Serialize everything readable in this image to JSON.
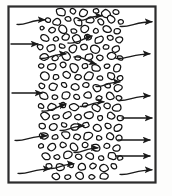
{
  "figure": {
    "canvas": {
      "width": 172,
      "height": 196,
      "background": "#fdfdfc"
    },
    "frame": {
      "label": "enclosure-boundary",
      "x": 8.5,
      "y": 6.5,
      "width": 147,
      "height": 176,
      "stroke": "#2b2b2b",
      "stroke_width": 2.2,
      "fill": "#ffffff"
    },
    "bed": {
      "label": "packed-particle-bed",
      "band_left": 36,
      "band_right": 122,
      "particle_stroke": "#111111",
      "particle_stroke_width": 1.25,
      "particle_fill": "#ffffff",
      "particle_count": 118
    },
    "colors": {
      "ink": "#1a1a1a",
      "frame": "#2b2b2b",
      "paper": "#ffffff",
      "page": "#fdfdfc"
    },
    "inlet_arrows": [
      {
        "name": "inlet-arrow-1",
        "style": "wavy",
        "y": 22,
        "x_start": 17,
        "x_end": 45
      },
      {
        "name": "inlet-arrow-2",
        "style": "straight",
        "y": 44,
        "x_start": 11,
        "x_end": 38
      },
      {
        "name": "inlet-arrow-3",
        "style": "straight",
        "y": 93,
        "x_start": 12,
        "x_end": 42
      },
      {
        "name": "inlet-arrow-4",
        "style": "wavy",
        "y": 138,
        "x_start": 15,
        "x_end": 47
      },
      {
        "name": "inlet-arrow-5",
        "style": "wavy",
        "y": 171,
        "x_start": 18,
        "x_end": 50
      }
    ],
    "outlet_arrows": [
      {
        "name": "outlet-arrow-1",
        "style": "wavy",
        "y": 24,
        "x_start": 120,
        "x_end": 152
      },
      {
        "name": "outlet-arrow-2",
        "style": "wavy",
        "y": 56,
        "x_start": 116,
        "x_end": 150
      },
      {
        "name": "outlet-arrow-3",
        "style": "wavy",
        "y": 98,
        "x_start": 118,
        "x_end": 150
      },
      {
        "name": "outlet-arrow-4",
        "style": "straight",
        "y": 118,
        "x_start": 122,
        "x_end": 152
      },
      {
        "name": "outlet-arrow-5",
        "style": "straight",
        "y": 140,
        "x_start": 118,
        "x_end": 150
      },
      {
        "name": "outlet-arrow-6",
        "style": "straight",
        "y": 156,
        "x_start": 116,
        "x_end": 150
      },
      {
        "name": "outlet-arrow-7",
        "style": "wavy",
        "y": 172,
        "x_start": 120,
        "x_end": 152
      }
    ],
    "interior_arrows": [
      {
        "name": "interior-arrow-1",
        "style": "wavy",
        "y": 18,
        "x_start": 78,
        "x_end": 102
      },
      {
        "name": "interior-arrow-2",
        "style": "wavy-up",
        "y": 40,
        "x_start": 68,
        "x_end": 92
      },
      {
        "name": "interior-arrow-3",
        "style": "wavy",
        "y": 56,
        "x_start": 40,
        "x_end": 66
      },
      {
        "name": "interior-arrow-4",
        "style": "wavy-down",
        "y": 60,
        "x_start": 74,
        "x_end": 96
      },
      {
        "name": "interior-arrow-5",
        "style": "wavy",
        "y": 84,
        "x_start": 96,
        "x_end": 120
      },
      {
        "name": "interior-arrow-6",
        "style": "wavy-up",
        "y": 108,
        "x_start": 42,
        "x_end": 66
      },
      {
        "name": "interior-arrow-7",
        "style": "wavy",
        "y": 104,
        "x_start": 80,
        "x_end": 104
      },
      {
        "name": "interior-arrow-8",
        "style": "wavy",
        "y": 128,
        "x_start": 60,
        "x_end": 84
      },
      {
        "name": "interior-arrow-9",
        "style": "wavy",
        "y": 150,
        "x_start": 74,
        "x_end": 98
      },
      {
        "name": "interior-arrow-10",
        "style": "wavy",
        "y": 166,
        "x_start": 50,
        "x_end": 74
      }
    ],
    "particles": [
      [
        61,
        12,
        5.0,
        4.0,
        12
      ],
      [
        73,
        11,
        3.4,
        2.8,
        40
      ],
      [
        83,
        13,
        4.6,
        3.6,
        -20
      ],
      [
        96,
        11,
        3.0,
        2.6,
        15
      ],
      [
        106,
        14,
        5.2,
        4.2,
        30
      ],
      [
        116,
        12,
        3.2,
        2.6,
        0
      ],
      [
        48,
        20,
        3.0,
        2.4,
        10
      ],
      [
        57,
        22,
        4.4,
        3.4,
        -15
      ],
      [
        68,
        19,
        3.2,
        2.6,
        25
      ],
      [
        78,
        22,
        5.0,
        3.8,
        50
      ],
      [
        90,
        20,
        4.2,
        3.4,
        -10
      ],
      [
        101,
        22,
        3.4,
        2.8,
        35
      ],
      [
        111,
        19,
        4.8,
        3.8,
        20
      ],
      [
        121,
        22,
        3.0,
        2.4,
        0
      ],
      [
        42,
        28,
        2.2,
        1.9,
        0
      ],
      [
        52,
        30,
        3.4,
        2.8,
        -25
      ],
      [
        63,
        29,
        5.0,
        4.0,
        45
      ],
      [
        74,
        31,
        3.2,
        2.6,
        10
      ],
      [
        85,
        29,
        4.6,
        3.6,
        -30
      ],
      [
        96,
        31,
        3.0,
        2.5,
        20
      ],
      [
        107,
        29,
        4.4,
        3.4,
        15
      ],
      [
        117,
        31,
        3.6,
        2.9,
        -15
      ],
      [
        45,
        38,
        4.6,
        3.6,
        25
      ],
      [
        56,
        39,
        3.0,
        2.4,
        0
      ],
      [
        66,
        37,
        4.2,
        3.4,
        -20
      ],
      [
        77,
        39,
        5.0,
        4.0,
        35
      ],
      [
        88,
        37,
        3.4,
        2.8,
        10
      ],
      [
        99,
        40,
        4.6,
        3.6,
        -25
      ],
      [
        110,
        38,
        3.2,
        2.6,
        15
      ],
      [
        119,
        40,
        4.0,
        3.2,
        0
      ],
      [
        40,
        47,
        3.2,
        2.6,
        20
      ],
      [
        51,
        48,
        4.8,
        3.8,
        -10
      ],
      [
        62,
        46,
        3.0,
        2.4,
        30
      ],
      [
        73,
        49,
        4.4,
        3.5,
        -35
      ],
      [
        84,
        47,
        3.4,
        2.8,
        0
      ],
      [
        95,
        49,
        5.0,
        3.9,
        25
      ],
      [
        106,
        47,
        3.2,
        2.6,
        10
      ],
      [
        116,
        49,
        4.2,
        3.4,
        -20
      ],
      [
        44,
        57,
        4.4,
        3.5,
        15
      ],
      [
        55,
        58,
        3.2,
        2.6,
        -20
      ],
      [
        66,
        56,
        4.8,
        3.8,
        40
      ],
      [
        78,
        58,
        3.0,
        2.4,
        0
      ],
      [
        89,
        57,
        4.4,
        3.5,
        -15
      ],
      [
        100,
        58,
        3.4,
        2.8,
        25
      ],
      [
        111,
        56,
        4.6,
        3.6,
        -10
      ],
      [
        120,
        58,
        3.0,
        2.4,
        20
      ],
      [
        41,
        66,
        3.0,
        2.5,
        0
      ],
      [
        52,
        67,
        4.6,
        3.6,
        -25
      ],
      [
        63,
        65,
        3.4,
        2.8,
        15
      ],
      [
        74,
        68,
        5.0,
        3.9,
        35
      ],
      [
        85,
        66,
        3.2,
        2.6,
        -10
      ],
      [
        96,
        68,
        4.4,
        3.5,
        20
      ],
      [
        107,
        66,
        3.0,
        2.4,
        0
      ],
      [
        117,
        68,
        4.6,
        3.6,
        -30
      ],
      [
        45,
        76,
        4.8,
        3.8,
        20
      ],
      [
        56,
        77,
        3.2,
        2.6,
        -15
      ],
      [
        67,
        75,
        4.2,
        3.4,
        30
      ],
      [
        78,
        77,
        3.4,
        2.8,
        0
      ],
      [
        89,
        76,
        5.0,
        3.9,
        -25
      ],
      [
        100,
        78,
        3.0,
        2.4,
        15
      ],
      [
        111,
        76,
        4.4,
        3.5,
        35
      ],
      [
        120,
        78,
        3.4,
        2.8,
        -10
      ],
      [
        42,
        86,
        3.4,
        2.8,
        10
      ],
      [
        53,
        87,
        4.6,
        3.6,
        -20
      ],
      [
        64,
        85,
        3.0,
        2.4,
        25
      ],
      [
        75,
        87,
        4.4,
        3.5,
        0
      ],
      [
        86,
        85,
        3.4,
        2.8,
        -15
      ],
      [
        97,
        88,
        4.8,
        3.8,
        30
      ],
      [
        108,
        86,
        3.2,
        2.6,
        10
      ],
      [
        118,
        88,
        4.2,
        3.4,
        -25
      ],
      [
        44,
        96,
        4.4,
        3.5,
        25
      ],
      [
        55,
        97,
        3.0,
        2.4,
        0
      ],
      [
        66,
        95,
        4.8,
        3.8,
        -20
      ],
      [
        77,
        97,
        3.4,
        2.8,
        35
      ],
      [
        88,
        95,
        4.2,
        3.4,
        10
      ],
      [
        99,
        98,
        3.0,
        2.5,
        -15
      ],
      [
        110,
        96,
        4.6,
        3.6,
        20
      ],
      [
        119,
        98,
        3.2,
        2.6,
        0
      ],
      [
        41,
        106,
        3.2,
        2.6,
        15
      ],
      [
        52,
        107,
        4.6,
        3.6,
        -30
      ],
      [
        63,
        105,
        3.4,
        2.8,
        20
      ],
      [
        74,
        107,
        4.8,
        3.8,
        0
      ],
      [
        85,
        105,
        3.0,
        2.4,
        -10
      ],
      [
        96,
        108,
        4.4,
        3.5,
        25
      ],
      [
        107,
        106,
        3.4,
        2.8,
        15
      ],
      [
        117,
        108,
        4.6,
        3.6,
        -20
      ],
      [
        45,
        116,
        4.8,
        3.8,
        30
      ],
      [
        56,
        117,
        3.2,
        2.6,
        0
      ],
      [
        67,
        115,
        4.2,
        3.4,
        -25
      ],
      [
        78,
        117,
        3.4,
        2.8,
        20
      ],
      [
        89,
        115,
        4.6,
        3.6,
        10
      ],
      [
        100,
        118,
        3.0,
        2.4,
        -15
      ],
      [
        111,
        116,
        4.4,
        3.5,
        35
      ],
      [
        120,
        118,
        3.4,
        2.8,
        0
      ],
      [
        42,
        126,
        3.4,
        2.8,
        20
      ],
      [
        53,
        127,
        4.4,
        3.5,
        -10
      ],
      [
        64,
        125,
        3.0,
        2.4,
        30
      ],
      [
        75,
        127,
        4.8,
        3.8,
        0
      ],
      [
        86,
        125,
        3.4,
        2.8,
        -20
      ],
      [
        97,
        128,
        4.2,
        3.4,
        15
      ],
      [
        108,
        126,
        3.2,
        2.6,
        25
      ],
      [
        118,
        128,
        4.6,
        3.6,
        -30
      ],
      [
        44,
        136,
        4.6,
        3.6,
        10
      ],
      [
        55,
        137,
        3.2,
        2.6,
        -20
      ],
      [
        66,
        135,
        4.4,
        3.5,
        25
      ],
      [
        77,
        137,
        3.4,
        2.8,
        0
      ],
      [
        88,
        136,
        4.8,
        3.8,
        -15
      ],
      [
        99,
        138,
        3.0,
        2.4,
        20
      ],
      [
        110,
        136,
        4.2,
        3.4,
        30
      ],
      [
        119,
        138,
        3.4,
        2.8,
        -10
      ],
      [
        41,
        146,
        3.0,
        2.4,
        0
      ],
      [
        52,
        147,
        4.8,
        3.8,
        -25
      ],
      [
        63,
        145,
        3.4,
        2.8,
        15
      ],
      [
        74,
        147,
        4.4,
        3.5,
        35
      ],
      [
        85,
        145,
        3.2,
        2.6,
        -10
      ],
      [
        96,
        148,
        4.6,
        3.6,
        20
      ],
      [
        107,
        146,
        3.4,
        2.8,
        0
      ],
      [
        117,
        148,
        4.2,
        3.4,
        -20
      ],
      [
        46,
        156,
        4.4,
        3.5,
        25
      ],
      [
        57,
        157,
        3.0,
        2.4,
        0
      ],
      [
        68,
        155,
        4.8,
        3.8,
        -30
      ],
      [
        79,
        157,
        3.4,
        2.8,
        15
      ],
      [
        90,
        156,
        4.2,
        3.4,
        10
      ],
      [
        101,
        158,
        3.2,
        2.6,
        -15
      ],
      [
        112,
        156,
        4.6,
        3.6,
        30
      ],
      [
        120,
        158,
        3.0,
        2.4,
        0
      ],
      [
        49,
        166,
        3.4,
        2.8,
        20
      ],
      [
        60,
        167,
        4.6,
        3.6,
        -10
      ],
      [
        71,
        165,
        3.0,
        2.4,
        25
      ],
      [
        82,
        167,
        4.4,
        3.5,
        0
      ],
      [
        93,
        166,
        3.4,
        2.8,
        -20
      ],
      [
        104,
        168,
        4.8,
        3.8,
        15
      ],
      [
        114,
        166,
        3.2,
        2.6,
        30
      ],
      [
        56,
        176,
        4.2,
        3.4,
        10
      ],
      [
        68,
        177,
        3.2,
        2.6,
        -20
      ],
      [
        80,
        176,
        4.6,
        3.6,
        25
      ],
      [
        92,
        177,
        3.0,
        2.4,
        0
      ],
      [
        104,
        176,
        4.2,
        3.4,
        -15
      ]
    ]
  }
}
